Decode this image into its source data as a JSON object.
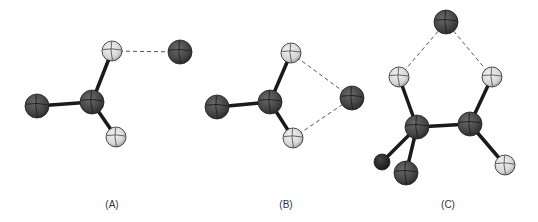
{
  "figure": {
    "colors": {
      "heavy_atom": "#4a4a4a",
      "heavy_atom_small": "#2a2a2a",
      "hydrogen_atom": "#dcdcdc",
      "bond": "#1a1a1a",
      "dashed_contact": "#555555",
      "label": "#333333"
    },
    "panels": [
      {
        "id": "A",
        "label": "(A)",
        "atoms": [
          {
            "id": "a_c",
            "element": "heavy",
            "role": "central"
          },
          {
            "id": "a_x",
            "element": "heavy",
            "role": "substituent-left"
          },
          {
            "id": "a_h1",
            "element": "hydrogen",
            "role": "upper"
          },
          {
            "id": "a_h2",
            "element": "hydrogen",
            "role": "lower"
          },
          {
            "id": "a_y",
            "element": "heavy",
            "role": "approaching-atom"
          }
        ],
        "bonds": [
          [
            "a_c",
            "a_x"
          ],
          [
            "a_c",
            "a_h1"
          ],
          [
            "a_c",
            "a_h2"
          ]
        ],
        "contacts": [
          [
            "a_h1",
            "a_y"
          ]
        ]
      },
      {
        "id": "B",
        "label": "(B)",
        "atoms": [
          {
            "id": "b_c",
            "element": "heavy",
            "role": "central"
          },
          {
            "id": "b_x",
            "element": "heavy",
            "role": "substituent-left"
          },
          {
            "id": "b_h1",
            "element": "hydrogen",
            "role": "upper"
          },
          {
            "id": "b_h2",
            "element": "hydrogen",
            "role": "lower"
          },
          {
            "id": "b_y",
            "element": "heavy",
            "role": "bridging-atom"
          }
        ],
        "bonds": [
          [
            "b_c",
            "b_x"
          ],
          [
            "b_c",
            "b_h1"
          ],
          [
            "b_c",
            "b_h2"
          ]
        ],
        "contacts": [
          [
            "b_h1",
            "b_y"
          ],
          [
            "b_h2",
            "b_y"
          ]
        ]
      },
      {
        "id": "C",
        "label": "(C)",
        "atoms": [
          {
            "id": "c_c1",
            "element": "heavy",
            "role": "carbon-left"
          },
          {
            "id": "c_c2",
            "element": "heavy",
            "role": "carbon-right"
          },
          {
            "id": "c_h1",
            "element": "hydrogen",
            "role": "upper-left"
          },
          {
            "id": "c_h2",
            "element": "hydrogen",
            "role": "upper-right"
          },
          {
            "id": "c_h3",
            "element": "hydrogen",
            "role": "lower-right"
          },
          {
            "id": "c_x1",
            "element": "heavy-small",
            "role": "substituent-far-left"
          },
          {
            "id": "c_x2",
            "element": "heavy",
            "role": "substituent-lower-left"
          },
          {
            "id": "c_y",
            "element": "heavy",
            "role": "bridging-atom-top"
          }
        ],
        "bonds": [
          [
            "c_c1",
            "c_c2"
          ],
          [
            "c_c1",
            "c_h1"
          ],
          [
            "c_c2",
            "c_h2"
          ],
          [
            "c_c2",
            "c_h3"
          ],
          [
            "c_c1",
            "c_x1"
          ],
          [
            "c_c1",
            "c_x2"
          ]
        ],
        "contacts": [
          [
            "c_h1",
            "c_y"
          ],
          [
            "c_h2",
            "c_y"
          ]
        ]
      }
    ]
  }
}
